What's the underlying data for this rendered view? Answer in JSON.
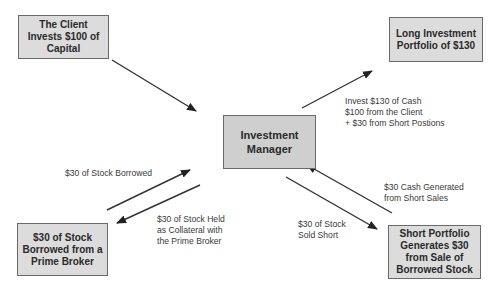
{
  "nodes": {
    "client": "The Client\nInvests $100 of\nCapital",
    "long_portfolio": "Long Investment\nPortfolio of $130",
    "manager": "Investment\nManager",
    "prime_broker": "$30 of Stock\nBorrowed from a\nPrime Broker",
    "short_portfolio": "Short Portfolio\nGenerates $30\nfrom Sale of\nBorrowed Stock"
  },
  "edges": {
    "invest_long": "Invest $130 of Cash\n$100 from the Client\n+ $30 from Short Postions",
    "stock_borrowed": "$30 of Stock Borrowed",
    "collateral": "$30 of Stock Held\nas Collateral with\nthe Prime Broker",
    "sold_short": "$30 of Stock\nSold Short",
    "cash_generated": "$30 Cash Generated\nfrom Short Sales"
  }
}
